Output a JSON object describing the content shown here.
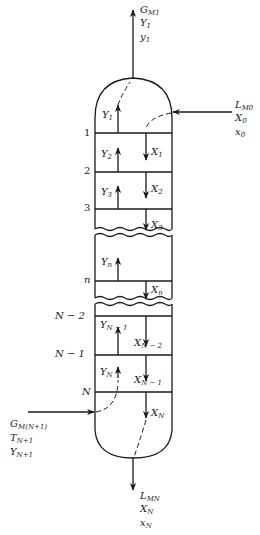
{
  "diagram": {
    "type": "countercurrent multistage column (absorber) schematic",
    "colors": {
      "line": "#1a1a1a",
      "background": "#ffffff"
    },
    "top_outlet": {
      "labels": [
        {
          "main": "G",
          "sub": "M1"
        },
        {
          "main": "Y",
          "sub": "1"
        },
        {
          "main": "y",
          "sub": "1"
        }
      ]
    },
    "top_inlet": {
      "labels": [
        {
          "main": "L",
          "sub": "M0"
        },
        {
          "main": "X",
          "sub": "0"
        },
        {
          "main": "x",
          "sub": "0"
        }
      ]
    },
    "bottom_inlet": {
      "labels": [
        {
          "main": "G",
          "sub": "M(N+1)"
        },
        {
          "main": "T",
          "sub": "N+1"
        },
        {
          "main": "Y",
          "sub": "N+1"
        }
      ]
    },
    "bottom_outlet": {
      "labels": [
        {
          "main": "L",
          "sub": "MN"
        },
        {
          "main": "X",
          "sub": "N"
        },
        {
          "main": "x",
          "sub": "N"
        }
      ]
    },
    "trays": [
      {
        "label": "1",
        "vapor_up": {
          "main": "Y",
          "sub": "1"
        }
      },
      {
        "label": "2",
        "vapor_up": {
          "main": "Y",
          "sub": "2"
        },
        "liquid_down": {
          "main": "X",
          "sub": "1"
        }
      },
      {
        "label": "3",
        "vapor_up": {
          "main": "Y",
          "sub": "3"
        },
        "liquid_down": {
          "main": "X",
          "sub": "2"
        }
      },
      {
        "label": "",
        "liquid_down": {
          "main": "X",
          "sub": "3"
        }
      },
      {
        "label": "n",
        "vapor_up": {
          "main": "Y",
          "sub": "n"
        },
        "liquid_down": {
          "main": "X",
          "sub": "n"
        }
      },
      {
        "label": "N − 2",
        "vapor_up": {
          "main": "Y",
          "sub": "N − 1"
        },
        "liquid_down": {
          "main": "X",
          "sub": "N − 2"
        }
      },
      {
        "label": "N − 1",
        "vapor_up": {
          "main": "Y",
          "sub": "N"
        },
        "liquid_down": {
          "main": "X",
          "sub": "N − 1"
        }
      },
      {
        "label": "N",
        "liquid_down": {
          "main": "X",
          "sub": "N"
        }
      }
    ]
  }
}
